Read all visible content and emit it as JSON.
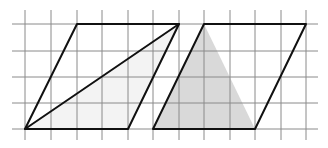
{
  "diagram": {
    "grid": {
      "x_lines": [
        25,
        51,
        77,
        102,
        128,
        153,
        179,
        204,
        230,
        255,
        281,
        306
      ],
      "y_lines": [
        24,
        51,
        77,
        103,
        129
      ],
      "x_extent": [
        12,
        318
      ],
      "y_extent": [
        10,
        140
      ],
      "color": "#8a8a8a"
    },
    "shapes": [
      {
        "name": "left-parallelogram",
        "points": [
          [
            25,
            129
          ],
          [
            77,
            24
          ],
          [
            179,
            24
          ],
          [
            128,
            129
          ]
        ],
        "stroke": "#111111"
      },
      {
        "name": "left-shaded-triangle",
        "points": [
          [
            25,
            129
          ],
          [
            179,
            24
          ],
          [
            128,
            129
          ]
        ],
        "fill": "#f3f3f3"
      },
      {
        "name": "left-diagonal",
        "points": [
          [
            25,
            129
          ],
          [
            179,
            24
          ]
        ],
        "stroke": "#111111"
      },
      {
        "name": "right-parallelogram",
        "points": [
          [
            153,
            129
          ],
          [
            204,
            24
          ],
          [
            306,
            24
          ],
          [
            255,
            129
          ]
        ],
        "stroke": "#111111"
      },
      {
        "name": "right-shaded-triangle",
        "points": [
          [
            153,
            129
          ],
          [
            204,
            24
          ],
          [
            255,
            129
          ]
        ],
        "fill": "#d9d9d9"
      }
    ]
  }
}
